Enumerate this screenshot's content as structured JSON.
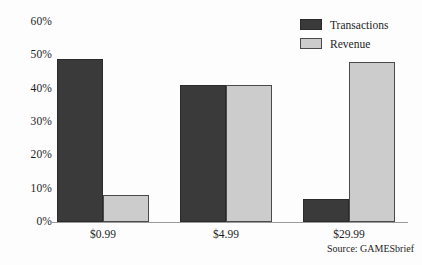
{
  "chart_data": {
    "type": "bar",
    "title": "",
    "subtitle": "",
    "xlabel": "",
    "ylabel": "",
    "categories": [
      "$0.99",
      "$4.99",
      "$29.99"
    ],
    "series": [
      {
        "name": "Transactions",
        "values": [
          49,
          41,
          7
        ],
        "color": "#3a3a3a"
      },
      {
        "name": "Revenue",
        "values": [
          8,
          41,
          48
        ],
        "color": "#cccccc"
      }
    ],
    "ylim": [
      0,
      60
    ],
    "yticks": [
      0,
      10,
      20,
      30,
      40,
      50,
      60
    ],
    "ytick_labels": [
      "0%",
      "10%",
      "20%",
      "30%",
      "40%",
      "50%",
      "60%"
    ],
    "grid": false,
    "legend_position": "top-right",
    "annotation": "Source: GAMESbrief",
    "value_suffix": "%"
  },
  "legend": {
    "entries": [
      {
        "label": "Transactions"
      },
      {
        "label": "Revenue"
      }
    ]
  },
  "axis": {
    "y_ticks": [
      "60%",
      "50%",
      "40%",
      "30%",
      "20%",
      "10%",
      "0%"
    ],
    "x_labels": [
      "$0.99",
      "$4.99",
      "$29.99"
    ]
  },
  "source": {
    "text": "Source: GAMESbrief"
  },
  "colors": {
    "transactions": "#3a3a3a",
    "revenue": "#cccccc",
    "axis": "#9a9a9a",
    "text": "#1d1d1d",
    "background": "#fdfdfd"
  }
}
